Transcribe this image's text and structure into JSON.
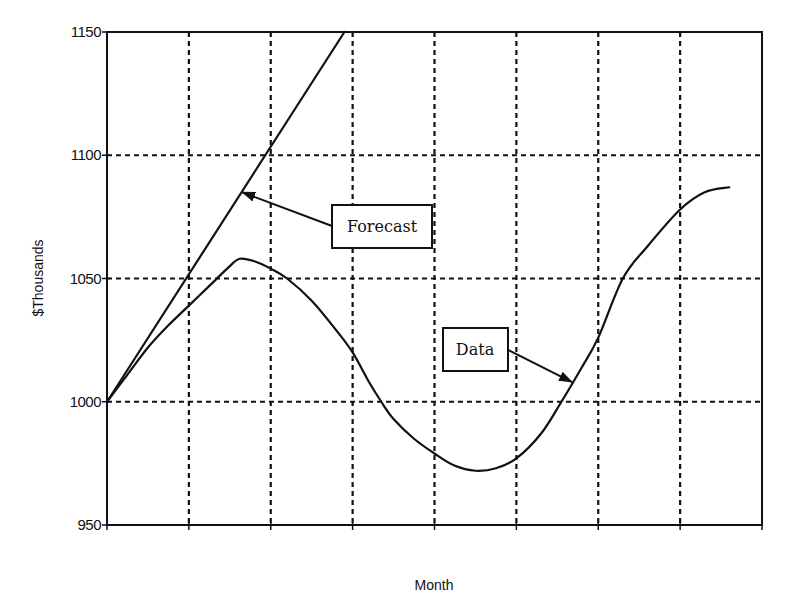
{
  "chart_data": {
    "type": "line",
    "title": "",
    "xlabel": "Month",
    "ylabel": "$Thousands",
    "xlim": [
      0,
      8
    ],
    "ylim": [
      950,
      1150
    ],
    "yticks": [
      950,
      1000,
      1050,
      1100,
      1150
    ],
    "ytick_labels": [
      "950",
      "1000",
      "1050",
      "1100",
      "1150"
    ],
    "xticks": [
      0,
      1,
      2,
      3,
      4,
      5,
      6,
      7,
      8
    ],
    "xtick_labels": [],
    "grid": true,
    "grid_style": "dashed",
    "legend": "none",
    "series": [
      {
        "name": "Data",
        "x": [
          0,
          0.25,
          0.5,
          0.75,
          1.0,
          1.25,
          1.5,
          1.62,
          1.8,
          2.0,
          2.2,
          2.5,
          2.8,
          3.0,
          3.2,
          3.35,
          3.5,
          3.75,
          4.0,
          4.25,
          4.5,
          4.75,
          5.0,
          5.3,
          5.55,
          5.8,
          6.0,
          6.3,
          6.6,
          7.0,
          7.3,
          7.6
        ],
        "values": [
          1000,
          1011,
          1022,
          1031,
          1039,
          1047,
          1055,
          1058,
          1057,
          1054,
          1050,
          1041,
          1029,
          1020,
          1008,
          1000,
          993,
          985,
          979,
          974,
          972,
          973,
          977,
          987,
          1000,
          1014,
          1026,
          1050,
          1063,
          1078,
          1085,
          1087
        ]
      },
      {
        "name": "Forecast",
        "x": [
          0,
          2.9
        ],
        "values": [
          1000,
          1150
        ]
      }
    ],
    "annotations": [
      {
        "text": "Forecast",
        "target_series": "Forecast",
        "points_to": [
          1.65,
          1085
        ]
      },
      {
        "text": "Data",
        "target_series": "Data",
        "points_to": [
          5.68,
          1008
        ]
      }
    ]
  }
}
